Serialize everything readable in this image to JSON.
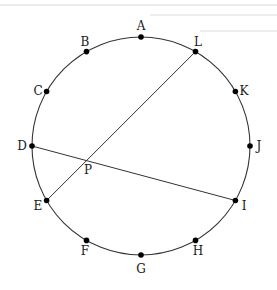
{
  "diagram": {
    "type": "circle-with-chords",
    "circle": {
      "cx": 141,
      "cy": 146,
      "r": 109
    },
    "stroke_color": "#333333",
    "point_color": "#000000",
    "points": [
      {
        "label": "A",
        "angle_deg": 90,
        "lx": 141,
        "ly": 30,
        "anchor": "middle"
      },
      {
        "label": "B",
        "angle_deg": 120,
        "lx": 85,
        "ly": 46,
        "anchor": "middle"
      },
      {
        "label": "C",
        "angle_deg": 150,
        "lx": 38,
        "ly": 95,
        "anchor": "middle"
      },
      {
        "label": "D",
        "angle_deg": 180,
        "lx": 22,
        "ly": 150,
        "anchor": "middle"
      },
      {
        "label": "E",
        "angle_deg": 210,
        "lx": 38,
        "ly": 210,
        "anchor": "middle"
      },
      {
        "label": "F",
        "angle_deg": 240,
        "lx": 85,
        "ly": 255,
        "anchor": "middle"
      },
      {
        "label": "G",
        "angle_deg": 270,
        "lx": 141,
        "ly": 273,
        "anchor": "middle"
      },
      {
        "label": "H",
        "angle_deg": 300,
        "lx": 198,
        "ly": 255,
        "anchor": "middle"
      },
      {
        "label": "I",
        "angle_deg": 330,
        "lx": 244,
        "ly": 210,
        "anchor": "middle"
      },
      {
        "label": "J",
        "angle_deg": 0,
        "lx": 259,
        "ly": 150,
        "anchor": "middle"
      },
      {
        "label": "K",
        "angle_deg": 30,
        "lx": 244,
        "ly": 95,
        "anchor": "middle"
      },
      {
        "label": "L",
        "angle_deg": 60,
        "lx": 198,
        "ly": 46,
        "anchor": "middle"
      }
    ],
    "chords": [
      {
        "from": "L",
        "to": "E"
      },
      {
        "from": "D",
        "to": "I"
      }
    ],
    "intersection": {
      "label": "P",
      "lx": 88,
      "ly": 174
    }
  }
}
